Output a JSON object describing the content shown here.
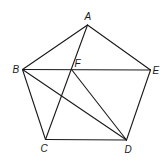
{
  "diagram": {
    "type": "geometry",
    "points": {
      "A": {
        "x": 87.5,
        "y": 25,
        "label": "A",
        "lx": 84.5,
        "ly": 20
      },
      "B": {
        "x": 22.5,
        "y": 69.5,
        "label": "B",
        "lx": 12.5,
        "ly": 73
      },
      "F": {
        "x": 71.5,
        "y": 69.5,
        "label": "F",
        "lx": 74.5,
        "ly": 67
      },
      "E": {
        "x": 150.5,
        "y": 70,
        "label": "E",
        "lx": 152.5,
        "ly": 74
      },
      "C": {
        "x": 45.5,
        "y": 139.5,
        "label": "C",
        "lx": 40.5,
        "ly": 152
      },
      "D": {
        "x": 126.5,
        "y": 140,
        "label": "D",
        "lx": 124.5,
        "ly": 153
      }
    },
    "segments": [
      [
        "A",
        "B"
      ],
      [
        "A",
        "E"
      ],
      [
        "B",
        "E"
      ],
      [
        "B",
        "C"
      ],
      [
        "C",
        "D"
      ],
      [
        "D",
        "E"
      ],
      [
        "A",
        "C"
      ],
      [
        "B",
        "D"
      ],
      [
        "F",
        "D"
      ]
    ],
    "stroke_color": "#1a1a1a"
  }
}
